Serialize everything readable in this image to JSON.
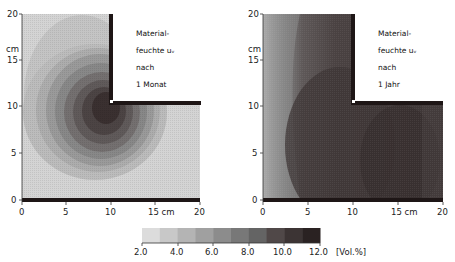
{
  "chart_data": [
    {
      "type": "heatmap",
      "title": "Materialfeuchte u_v nach 1 Monat",
      "annotation_lines": [
        "Material-",
        "feuchte uᵥ",
        "nach",
        "1 Monat"
      ],
      "xlabel": "cm",
      "ylabel": "cm",
      "x_ticks": [
        "0",
        "5",
        "10",
        "15 cm",
        "20"
      ],
      "y_ticks": [
        "0",
        "5",
        "10",
        "15",
        "20"
      ],
      "y_unit_label": "cm",
      "xlim": [
        0,
        20
      ],
      "ylim": [
        0,
        20
      ],
      "geometry": "L-shaped corner section; region x>10,y>10 is empty (outside)",
      "description": "Concentric moisture contours centered near the inner corner (x≈9, y≈9), peak ≈12 Vol.% decreasing outward to ≈2–4 Vol.% at outer edges",
      "contour_centers": [
        {
          "x": 9,
          "y": 9,
          "value": 12.0
        }
      ],
      "edge_value_approx": 3.0
    },
    {
      "type": "heatmap",
      "title": "Materialfeuchte u_v nach 1 Jahr",
      "annotation_lines": [
        "Material-",
        "feuchte uᵥ",
        "nach",
        "1 Jahr"
      ],
      "xlabel": "cm",
      "ylabel": "cm",
      "x_ticks": [
        "0",
        "5",
        "10",
        "15 cm",
        "20"
      ],
      "y_ticks": [
        "0",
        "5",
        "10",
        "15",
        "20"
      ],
      "y_unit_label": "cm",
      "xlim": [
        0,
        20
      ],
      "ylim": [
        0,
        20
      ],
      "geometry": "L-shaped corner section; region x>10,y>10 is empty (outside)",
      "description": "Moisture high (≈10–12 Vol.%) over most of section, darkest near corner and lower right; low (≈2–4 Vol.%) only along left edge x<2",
      "edge_value_approx": 2.5
    }
  ],
  "colorbar": {
    "ticks": [
      "2.0",
      "4.0",
      "6.0",
      "8.0",
      "10.0",
      "12.0"
    ],
    "unit": "[Vol.%]",
    "min": 2.0,
    "max": 12.0,
    "levels": 10,
    "colors": [
      "#dcdcdc",
      "#c8c8c8",
      "#b4b4b4",
      "#a0a0a0",
      "#8c8c8c",
      "#787878",
      "#646464",
      "#504848",
      "#3c3434",
      "#2a2222"
    ]
  },
  "left": {
    "y_unit": "cm",
    "y_ticks": [
      "20",
      "15",
      "10",
      "5",
      "0"
    ],
    "x_ticks": [
      "0",
      "5",
      "10",
      "15 cm",
      "20"
    ],
    "annotation": [
      "Material-",
      "feuchte uᵥ",
      "nach",
      "1 Monat"
    ]
  },
  "right": {
    "y_unit": "cm",
    "y_ticks": [
      "20",
      "15",
      "10",
      "5",
      "0"
    ],
    "x_ticks": [
      "0",
      "5",
      "10",
      "15 cm",
      "20"
    ],
    "annotation": [
      "Material-",
      "feuchte uᵥ",
      "nach",
      "1 Jahr"
    ]
  }
}
